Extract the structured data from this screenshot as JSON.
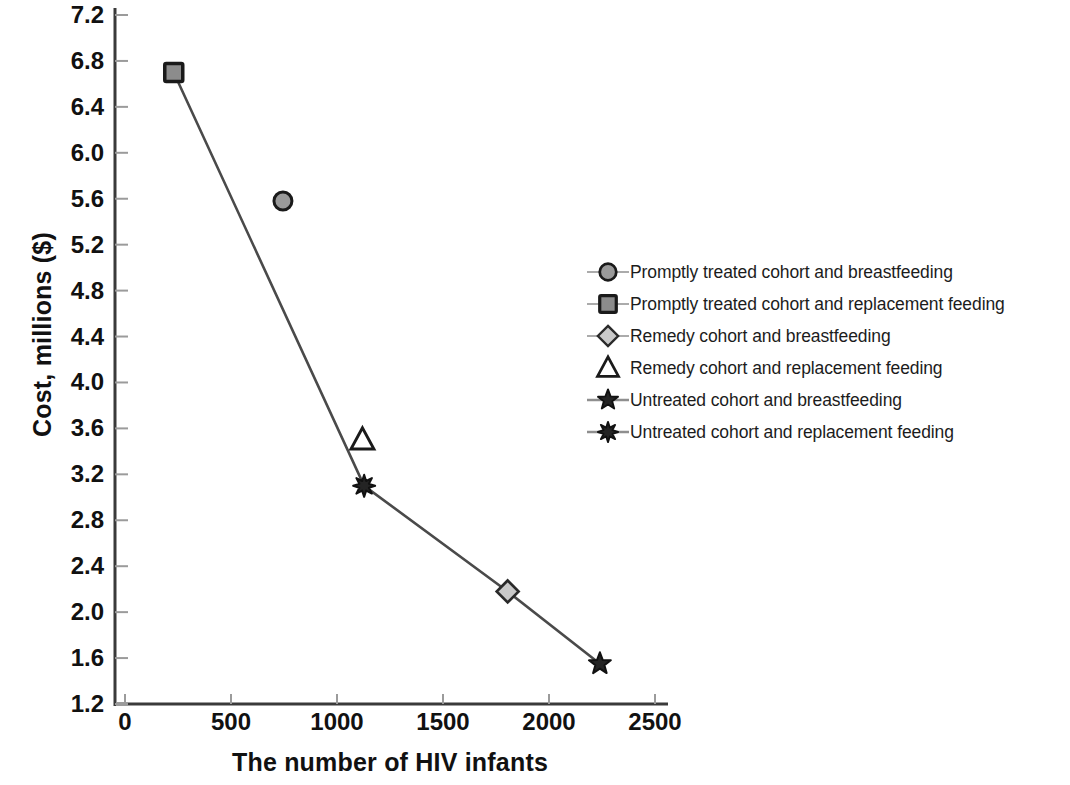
{
  "chart_data": {
    "type": "scatter",
    "title": "",
    "xlabel": "The number of HIV infants",
    "ylabel": "Cost, millions ($)",
    "xlim": [
      0,
      2500
    ],
    "ylim": [
      1.2,
      7.2
    ],
    "xticks": [
      0,
      500,
      1000,
      1500,
      2000,
      2500
    ],
    "yticks": [
      1.2,
      1.6,
      2.0,
      2.4,
      2.8,
      3.2,
      3.6,
      4.0,
      4.4,
      4.8,
      5.2,
      5.6,
      6.0,
      6.4,
      6.8,
      7.2
    ],
    "xtick_labels": [
      "0",
      "500",
      "1000",
      "1500",
      "2000",
      "2500"
    ],
    "ytick_labels": [
      "1.2",
      "1.6",
      "2.0",
      "2.4",
      "2.8",
      "3.2",
      "3.6",
      "4.0",
      "4.4",
      "4.8",
      "5.2",
      "5.6",
      "6.0",
      "6.4",
      "6.8",
      "7.2"
    ],
    "grid": false,
    "legend_position": "right-center",
    "connecting_line": {
      "description": "cost-effectiveness frontier connecting the square, starburst, diamond and star points",
      "points": [
        [
          230,
          6.7
        ],
        [
          1128,
          3.1
        ],
        [
          1805,
          2.18
        ],
        [
          2240,
          1.55
        ]
      ]
    },
    "series": [
      {
        "name": "Promptly treated cohort and breastfeeding",
        "marker": "circle",
        "marker_fill": "#9a9a9a",
        "marker_edge": "#1a1a1a",
        "x": [
          745
        ],
        "y": [
          5.58
        ],
        "on_line": false
      },
      {
        "name": "Promptly treated cohort and replacement feeding",
        "marker": "square",
        "marker_fill": "#8c8c8c",
        "marker_edge": "#1a1a1a",
        "x": [
          230
        ],
        "y": [
          6.7
        ],
        "on_line": true
      },
      {
        "name": "Remedy cohort and breastfeeding",
        "marker": "diamond",
        "marker_fill": "#c9c9c9",
        "marker_edge": "#2a2a2a",
        "x": [
          1805
        ],
        "y": [
          2.18
        ],
        "on_line": true
      },
      {
        "name": "Remedy cohort and replacement feeding",
        "marker": "triangle",
        "marker_fill": "#ffffff",
        "marker_edge": "#1a1a1a",
        "x": [
          1120
        ],
        "y": [
          3.5
        ],
        "on_line": false
      },
      {
        "name": "Untreated cohort and breastfeeding",
        "marker": "star",
        "marker_fill": "#242424",
        "marker_edge": "#111111",
        "x": [
          2240
        ],
        "y": [
          1.55
        ],
        "on_line": true
      },
      {
        "name": "Untreated cohort and replacement feeding",
        "marker": "starburst",
        "marker_fill": "#242424",
        "marker_edge": "#111111",
        "x": [
          1128
        ],
        "y": [
          3.1
        ],
        "on_line": true
      }
    ]
  },
  "axes": {
    "x_title": "The number of HIV infants",
    "y_title": "Cost, millions ($)"
  },
  "legend": {
    "entries": [
      {
        "label": "Promptly treated cohort and breastfeeding",
        "marker": "circle"
      },
      {
        "label": "Promptly treated cohort and replacement feeding",
        "marker": "square"
      },
      {
        "label": "Remedy cohort and breastfeeding",
        "marker": "diamond"
      },
      {
        "label": "Remedy cohort and replacement feeding",
        "marker": "triangle"
      },
      {
        "label": "Untreated cohort and breastfeeding",
        "marker": "star"
      },
      {
        "label": "Untreated cohort and replacement feeding",
        "marker": "starburst"
      }
    ]
  },
  "colors": {
    "axis": "#3a3a3a",
    "line": "#4a4a4a",
    "text": "#111111"
  }
}
